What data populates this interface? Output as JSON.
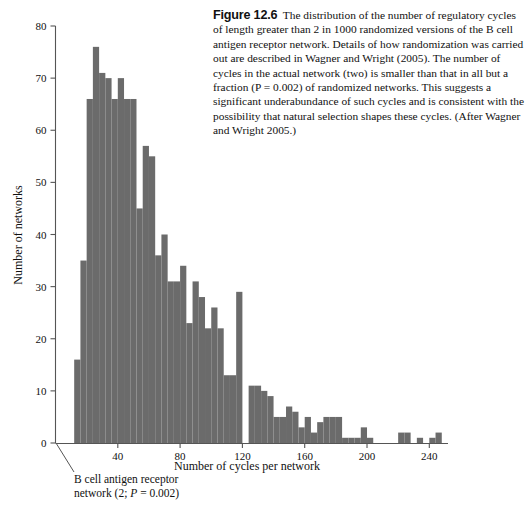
{
  "figure": {
    "number": "12.6",
    "caption_text": "The distribution of the number of regulatory cycles of length greater than 2 in 1000 randomized versions of the B cell antigen receptor network. Details of how randomization was carried out are described in Wagner and Wright (2005). The number of cycles in the actual network (two) is smaller than that in all but a fraction (P = 0.002) of randomized networks. This suggests a significant underabundance of such cycles and is consistent with the possibility that natural selection shapes these cycles. (After Wagner and Wright 2005.)"
  },
  "annotation": {
    "line1": "B cell antigen receptor",
    "line2_prefix": "network (2; ",
    "line2_italic": "P",
    "line2_suffix": " = 0.002)"
  },
  "colors": {
    "bar_fill": "#6b6b6b",
    "axis": "#555555",
    "text": "#111111",
    "background": "#ffffff"
  },
  "chart_data": {
    "type": "bar",
    "title": "",
    "xlabel": "Number of cycles per network",
    "ylabel": "Number of networks",
    "xlim": [
      0,
      252
    ],
    "ylim": [
      0,
      80
    ],
    "xticks": [
      40,
      80,
      120,
      160,
      200,
      240
    ],
    "yticks": [
      0,
      10,
      20,
      30,
      40,
      50,
      60,
      70,
      80
    ],
    "grid": false,
    "legend": null,
    "bin_width": 4,
    "bin_starts": [
      12,
      16,
      20,
      24,
      28,
      32,
      36,
      40,
      44,
      48,
      52,
      56,
      60,
      64,
      68,
      72,
      76,
      80,
      84,
      88,
      92,
      96,
      100,
      104,
      108,
      112,
      116,
      120,
      124,
      128,
      132,
      136,
      140,
      144,
      148,
      152,
      156,
      160,
      164,
      168,
      172,
      176,
      180,
      184,
      188,
      192,
      196,
      200,
      204,
      208,
      212,
      216,
      220,
      224,
      228,
      232,
      236,
      240,
      244,
      248
    ],
    "categories": [
      "12",
      "16",
      "20",
      "24",
      "28",
      "32",
      "36",
      "40",
      "44",
      "48",
      "52",
      "56",
      "60",
      "64",
      "68",
      "72",
      "76",
      "80",
      "84",
      "88",
      "92",
      "96",
      "100",
      "104",
      "108",
      "112",
      "116",
      "120",
      "124",
      "128",
      "132",
      "136",
      "140",
      "144",
      "148",
      "152",
      "156",
      "160",
      "164",
      "168",
      "172",
      "176",
      "180",
      "184",
      "188",
      "192",
      "196",
      "200",
      "204",
      "208",
      "212",
      "216",
      "220",
      "224",
      "228",
      "232",
      "236",
      "240",
      "244",
      "248"
    ],
    "values": [
      16,
      35,
      66,
      76,
      71,
      70,
      66,
      70,
      66,
      66,
      45,
      57,
      55,
      36,
      40,
      31,
      31,
      34,
      23,
      31,
      28,
      22,
      26,
      22,
      13,
      13,
      29,
      0,
      11,
      11,
      10,
      9,
      5,
      5,
      7,
      6,
      3,
      5,
      2,
      4,
      5,
      5,
      5,
      1,
      1,
      1,
      3,
      1,
      0,
      0,
      0,
      0,
      2,
      2,
      0,
      1,
      0,
      1,
      2,
      0
    ]
  }
}
